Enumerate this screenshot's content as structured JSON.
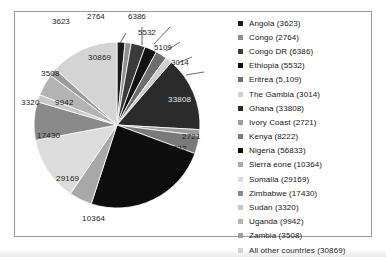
{
  "chart_data": {
    "type": "pie",
    "title": "",
    "xlabel": "",
    "ylabel": "",
    "total": 236063,
    "legend_position": "right",
    "grid": false,
    "categories": [
      "Angola",
      "Congo",
      "Congo DR",
      "Ethiopia",
      "Eritrea",
      "The Gambia",
      "Ghana",
      "Ivory Coast",
      "Kenya",
      "Nigeria",
      "Sierra eone",
      "Somalia",
      "Zimbabwe",
      "Sudan",
      "Uganda",
      "Zambia",
      "All other countries"
    ],
    "values": [
      3623,
      2764,
      6386,
      5532,
      5109,
      3014,
      33808,
      2721,
      8222,
      56833,
      10364,
      29169,
      17430,
      3320,
      9942,
      3508,
      30869
    ],
    "legend_labels": [
      "Angola (3623)",
      "Congo (2764)",
      "Congo DR (6386)",
      "Ethiopia (5532)",
      "Eritrea (5,109)",
      "The Gambia (3014)",
      "Ghana (33808)",
      "Ivory Coast (2721)",
      "Kenya (8222)",
      "Nigeria (56833)",
      "Sierra eone (10364)",
      "Somalia (29169)",
      "Zimbabwe (17430)",
      "Sudan (3320)",
      "Uganda (9942)",
      "Zambia (3508)",
      "All other countries (30869)"
    ],
    "slice_colors": [
      "#1a1a1a",
      "#8f8f8f",
      "#3a3a3a",
      "#111111",
      "#6e6e6e",
      "#cfcfcf",
      "#2b2b2b",
      "#9d9d9d",
      "#7a7a7a",
      "#0d0d0d",
      "#a8a8a8",
      "#dcdcdc",
      "#8a8a8a",
      "#c8c8c8",
      "#b4b4b4",
      "#9c9c9c",
      "#d4d4d4"
    ],
    "data_labels": [
      "3623",
      "2764",
      "6386",
      "5532",
      "5109",
      "3014",
      "33808",
      "2721",
      "8222",
      "56833",
      "10364",
      "29169",
      "17430",
      "3320",
      "9942",
      "3508",
      "30869"
    ],
    "visible_slice_labels": [
      "3623",
      "2764",
      "6386",
      "5532",
      "5109",
      "3014",
      "33808",
      "2721",
      "8222",
      "10364",
      "29169",
      "17430",
      "3320",
      "9942",
      "3508",
      "30869"
    ]
  },
  "pie": {
    "leader_labels": [
      {
        "text": "3623",
        "x": 38,
        "y": 6
      },
      {
        "text": "2764",
        "x": 73,
        "y": 1
      },
      {
        "text": "6386",
        "x": 114,
        "y": 1
      },
      {
        "text": "5532",
        "x": 124,
        "y": 17
      },
      {
        "text": "5109",
        "x": 140,
        "y": 32
      },
      {
        "text": "3014",
        "x": 157,
        "y": 47
      }
    ],
    "slice_labels": [
      {
        "text": "33808",
        "x": 154,
        "y": 84,
        "dark": true
      },
      {
        "text": "2721",
        "x": 168,
        "y": 121,
        "dark": false
      },
      {
        "text": "8222",
        "x": 154,
        "y": 133,
        "dark": false
      },
      {
        "text": "30869",
        "x": 74,
        "y": 42,
        "dark": false
      },
      {
        "text": "3508",
        "x": 27,
        "y": 58,
        "dark": false
      },
      {
        "text": "3320",
        "x": 7,
        "y": 87,
        "dark": false
      },
      {
        "text": "9942",
        "x": 41,
        "y": 87,
        "dark": false
      },
      {
        "text": "17430",
        "x": 23,
        "y": 120,
        "dark": false
      },
      {
        "text": "29169",
        "x": 42,
        "y": 163,
        "dark": false
      },
      {
        "text": "10364",
        "x": 68,
        "y": 203,
        "dark": false
      }
    ]
  }
}
